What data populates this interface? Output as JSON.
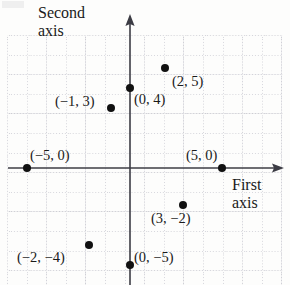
{
  "figure": {
    "kind": "cartesian-coordinate-plane",
    "background_color": "#fdfdfc",
    "ink_color": "#111111",
    "grid_color": "#8282964d"
  },
  "axis_labels": {
    "vertical_line1": "Second",
    "vertical_line2": "axis",
    "horizontal_line1": "First",
    "horizontal_line2": "axis"
  },
  "chart_data": {
    "type": "scatter",
    "title": "",
    "subtitle": "",
    "xlabel": "First axis",
    "ylabel": "Second axis",
    "xlim": [
      -6,
      7
    ],
    "ylim": [
      -6,
      6
    ],
    "grid": true,
    "grid_style": "dotted",
    "legend": "none",
    "axis_arrows": [
      "x-positive",
      "y-positive"
    ],
    "tick_labels_shown": false,
    "x": [
      2,
      0,
      -1,
      -5,
      5,
      3,
      -2,
      0
    ],
    "y": [
      5,
      4,
      3,
      0,
      0,
      -2,
      -4,
      -5
    ],
    "point_labels": [
      "(2, 5)",
      "(0, 4)",
      "(−1, 3)",
      "(−5, 0)",
      "(5, 0)",
      "(3, −2)",
      "(−2, −4)",
      "(0, −5)"
    ],
    "points": [
      {
        "label": "(2, 5)",
        "x": 2,
        "y": 5,
        "px": 165,
        "py": 68,
        "lx": 172,
        "ly": 74
      },
      {
        "label": "(0, 4)",
        "x": 0,
        "y": 4,
        "px": 130,
        "py": 88,
        "lx": 134,
        "ly": 92
      },
      {
        "label": "(−1, 3)",
        "x": -1,
        "y": 3,
        "px": 111,
        "py": 108,
        "lx": 55,
        "ly": 94
      },
      {
        "label": "(−5, 0)",
        "x": -5,
        "y": 0,
        "px": 27,
        "py": 168,
        "lx": 30,
        "ly": 148
      },
      {
        "label": "(5, 0)",
        "x": 5,
        "y": 0,
        "px": 222,
        "py": 168,
        "lx": 186,
        "ly": 148
      },
      {
        "label": "(3, −2)",
        "x": 3,
        "y": -2,
        "px": 183,
        "py": 205,
        "lx": 151,
        "ly": 211
      },
      {
        "label": "(−2, −4)",
        "x": -2,
        "y": -4,
        "px": 89,
        "py": 245,
        "lx": 17,
        "ly": 250
      },
      {
        "label": "(0, −5)",
        "x": 0,
        "y": -5,
        "px": 130,
        "py": 265,
        "lx": 134,
        "ly": 250
      }
    ]
  }
}
